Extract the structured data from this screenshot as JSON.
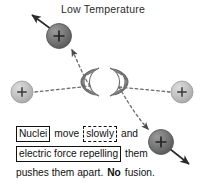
{
  "title": "Low Temperature",
  "colors": {
    "background": "#ffffff",
    "nucleus_dark": "#6e6e6e",
    "nucleus_dark_edge": "#4a4a4a",
    "nucleus_light": "#b9b9b9",
    "nucleus_light_edge": "#9a9a9a",
    "stroke": "#111111",
    "text": "#111111",
    "title_text": "#2b2b2b",
    "wave": "#707070"
  },
  "caption": {
    "line1": {
      "boxed_solid": "Nuclei",
      "plain_mid": "move",
      "boxed_dashed": "slowly",
      "plain_end": "and"
    },
    "line2": {
      "boxed_solid": "electric force repelling",
      "plain_end": "them"
    },
    "line3": {
      "before": "pushes them apart.",
      "bold": "No",
      "after": "fusion."
    }
  },
  "diagram": {
    "type": "physics-illustration",
    "particles": [
      {
        "name": "nucleus-upper-left",
        "charge": "+",
        "shade": "dark",
        "cx": 59,
        "cy": 36,
        "r": 12.5,
        "outgoing_arrow": {
          "x2": 31,
          "y2": 14
        }
      },
      {
        "name": "nucleus-left",
        "charge": "+",
        "shade": "light",
        "cx": 22,
        "cy": 92,
        "r": 11
      },
      {
        "name": "nucleus-right",
        "charge": "+",
        "shade": "light",
        "cx": 182,
        "cy": 92,
        "r": 11
      },
      {
        "name": "nucleus-lower-right",
        "charge": "+",
        "shade": "dark",
        "cx": 161,
        "cy": 142,
        "r": 12.5,
        "outgoing_arrow": {
          "x2": 190,
          "y2": 165
        }
      }
    ],
    "wave_fans": [
      {
        "name": "repulsion-wave-left",
        "cx": 98,
        "cy": 82,
        "arcs": 6,
        "opens": "left"
      },
      {
        "name": "repulsion-wave-right",
        "cx": 110,
        "cy": 82,
        "arcs": 6,
        "opens": "right"
      }
    ],
    "trajectories": [
      {
        "name": "trajectory-left-incoming",
        "style": "dashed",
        "from": [
          35,
          92
        ],
        "to": [
          92,
          84
        ]
      },
      {
        "name": "trajectory-upper-left-deflected",
        "style": "dashed",
        "to": [
          70,
          47
        ],
        "arrowhead": true
      },
      {
        "name": "trajectory-right-incoming",
        "style": "dashed",
        "from": [
          170,
          92
        ],
        "to": [
          118,
          86
        ]
      },
      {
        "name": "trajectory-lower-right-deflected",
        "style": "dashed",
        "to": [
          150,
          131
        ],
        "arrowhead": true
      }
    ]
  }
}
